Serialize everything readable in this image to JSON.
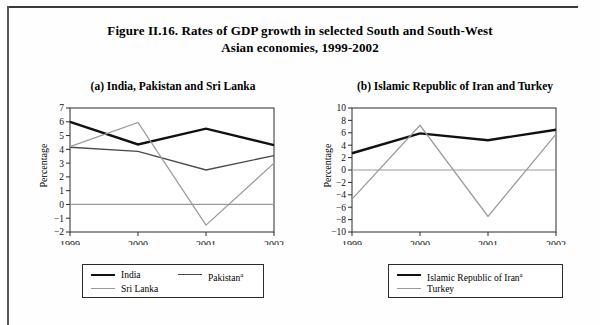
{
  "figure": {
    "title_line1": "Figure II.16.  Rates of GDP growth in selected South and South-West",
    "title_line2": "Asian economies, 1999-2002"
  },
  "panel_a": {
    "title": "(a)   India, Pakistan and Sri Lanka",
    "ylabel": "Percentage",
    "legend": [
      {
        "label": "India",
        "color": "#111111"
      },
      {
        "label": "Pakistan",
        "sup": "a",
        "color": "#4a4a4a"
      },
      {
        "label": "Sri  Lanka",
        "color": "#9a9a9a"
      }
    ]
  },
  "panel_b": {
    "title": "(b)   Islamic Republic of Iran and Turkey",
    "ylabel": "Percentage",
    "legend": [
      {
        "label": "Islamic Republic of Iran",
        "sup": "a",
        "color": "#111111"
      },
      {
        "label": "Turkey",
        "color": "#9a9a9a"
      }
    ]
  },
  "chart_data": [
    {
      "type": "line",
      "title": "(a)   India, Pakistan and Sri Lanka",
      "xlabel": "",
      "ylabel": "Percentage",
      "categories": [
        "1999",
        "2000",
        "2001",
        "2002"
      ],
      "x": [
        1999,
        2000,
        2001,
        2002
      ],
      "ylim": [
        -2,
        7
      ],
      "yticks": [
        -2,
        -1,
        0,
        1,
        2,
        3,
        4,
        5,
        6,
        7
      ],
      "ytick_labels": [
        "−2",
        "−1",
        "0",
        "1",
        "2",
        "3",
        "4",
        "5",
        "6",
        "7"
      ],
      "grid": false,
      "zero_line": true,
      "legend_position": "bottom",
      "series": [
        {
          "name": "India",
          "values": [
            6.0,
            4.35,
            5.5,
            4.3
          ],
          "color": "#111111",
          "width": 2.4
        },
        {
          "name": "Pakistan",
          "values": [
            4.15,
            3.85,
            2.5,
            3.55
          ],
          "color": "#4a4a4a",
          "width": 1.3
        },
        {
          "name": "Sri  Lanka",
          "values": [
            4.2,
            5.95,
            -1.5,
            3.0
          ],
          "color": "#9a9a9a",
          "width": 1.3
        }
      ]
    },
    {
      "type": "line",
      "title": "(b)   Islamic Republic of Iran and Turkey",
      "xlabel": "",
      "ylabel": "Percentage",
      "categories": [
        "1999",
        "2000",
        "2001",
        "2002"
      ],
      "x": [
        1999,
        2000,
        2001,
        2002
      ],
      "ylim": [
        -10,
        10
      ],
      "yticks": [
        -10,
        -8,
        -6,
        -4,
        -2,
        0,
        2,
        4,
        6,
        8,
        10
      ],
      "ytick_labels": [
        "−10",
        "−8",
        "−6",
        "−4",
        "−2",
        "0",
        "2",
        "4",
        "6",
        "8",
        "10"
      ],
      "grid": false,
      "zero_line": true,
      "legend_position": "bottom",
      "series": [
        {
          "name": "Islamic Republic of Iran",
          "values": [
            2.7,
            5.9,
            4.8,
            6.5
          ],
          "color": "#111111",
          "width": 2.4
        },
        {
          "name": "Turkey",
          "values": [
            -4.7,
            7.2,
            -7.5,
            5.8
          ],
          "color": "#9a9a9a",
          "width": 1.3
        }
      ]
    }
  ]
}
